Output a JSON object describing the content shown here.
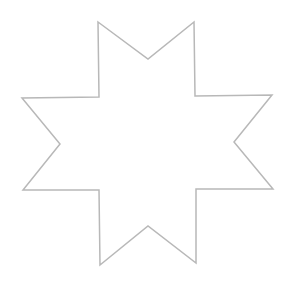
{
  "canvas": {
    "width": 291,
    "height": 295,
    "background": "#ffffff"
  },
  "shape": {
    "type": "eight-pointed-star",
    "stroke": "#b8b8b8",
    "stroke_width": 1.5,
    "fill": "none",
    "points": [
      [
        98,
        22
      ],
      [
        148,
        59
      ],
      [
        194,
        22
      ],
      [
        195,
        96
      ],
      [
        272,
        95
      ],
      [
        234,
        142
      ],
      [
        273,
        189
      ],
      [
        196,
        189
      ],
      [
        196,
        263
      ],
      [
        148,
        226
      ],
      [
        100,
        265
      ],
      [
        99,
        190
      ],
      [
        23,
        190
      ],
      [
        60,
        144
      ],
      [
        22,
        98
      ],
      [
        99,
        97
      ]
    ],
    "points_attr": "98,22 148,59 194,22 195,96 272,95 234,142 273,189 196,189 196,263 148,226 100,265 99,190 23,190 60,144 22,98 99,97"
  }
}
